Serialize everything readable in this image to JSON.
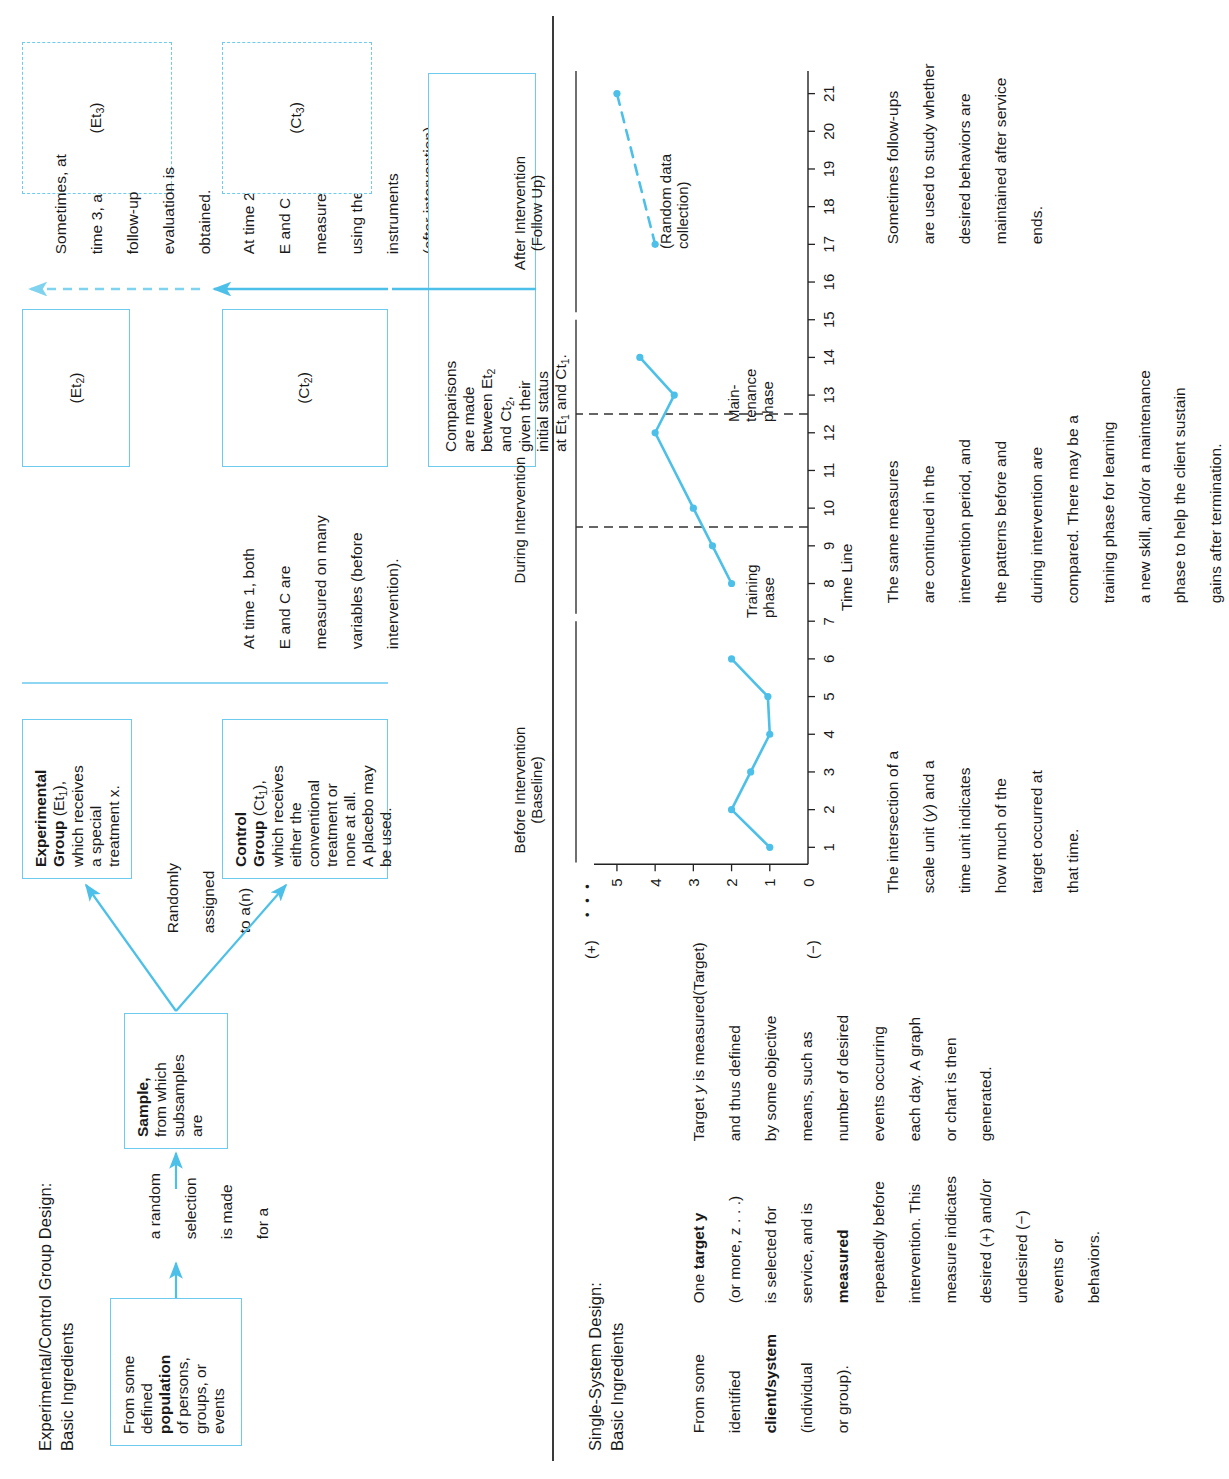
{
  "top_section": {
    "title_line1": "Experimental/Control Group Design:",
    "title_line2": "Basic Ingredients",
    "population_box": {
      "l1": "From some",
      "l2": "defined",
      "l3_bold": "population",
      "l4": "of persons,",
      "l5": "groups, or",
      "l6": "events"
    },
    "arrow_note_1": {
      "l1": "a random",
      "l2": "selection",
      "l3": "is made",
      "l4": "for a"
    },
    "sample_box": {
      "l1_bold": "Sample,",
      "l2": "from which",
      "l3": "subsamples",
      "l4": "are"
    },
    "arrow_note_2": {
      "l1": "Randomly",
      "l2": "assigned",
      "l3": "to a(n)"
    },
    "experimental_box": {
      "l1_bold": "Experimental",
      "l2_bold": "Group",
      "l2_rest": " (Et",
      "l2_sub": "1",
      "l2_end": "),",
      "l3": "which receives",
      "l4": "a special",
      "l5": "treatment x."
    },
    "control_box": {
      "l1_bold": "Control",
      "l2_bold": "Group",
      "l2_rest": " (Ct",
      "l2_sub": "1",
      "l2_end": "),",
      "l3": "which receives",
      "l4": "either the",
      "l5": "conventional",
      "l6": "treatment or",
      "l7": "none at all.",
      "l8": "A placebo may",
      "l9": "be used."
    },
    "time1_note": {
      "l1": "At time 1, both",
      "l2": "E and C are",
      "l3": "measured on many",
      "l4": "variables (before",
      "l5": "intervention)."
    },
    "et2_box_label": "(Et",
    "et2_box_sub": "2",
    "et2_box_end": ")",
    "ct2_box_label": "(Ct",
    "ct2_box_sub": "2",
    "ct2_box_end": ")",
    "time2_note": {
      "l1": "At time 2, both",
      "l2": "E and C are",
      "l3": "measured again",
      "l4": "using the same",
      "l5": "instruments",
      "l6": "(after intervention)."
    },
    "comparisons_box": {
      "l1": "Comparisons",
      "l2": "are made",
      "l3": "between Et",
      "l3_sub": "2",
      "l4": "and Ct",
      "l4_sub": "2",
      "l4_end": ",",
      "l5": "given their",
      "l6": "initial status",
      "l7a": "at Et",
      "l7_sub1": "1",
      "l7b": " and Ct",
      "l7_sub2": "1",
      "l7_end": "."
    },
    "et3_box_label": "(Et",
    "et3_box_sub": "3",
    "et3_box_end": ")",
    "ct3_box_label": "(Ct",
    "ct3_box_sub": "3",
    "ct3_box_end": ")",
    "time3_note": {
      "l1": "Sometimes, at",
      "l2": "time 3, a",
      "l3": "follow-up",
      "l4": "evaluation is",
      "l5": "obtained."
    }
  },
  "bottom_section": {
    "title_line1": "Single-System Design:",
    "title_line2": "Basic Ingredients",
    "client_note": {
      "l1": "From some",
      "l2": "identified",
      "l3_bold": "client/system",
      "l4": "(individual",
      "l5": "or group)."
    },
    "target_note": {
      "l1a": "One ",
      "l1_bold": "target y",
      "l2": "(or more, z . . .)",
      "l3": "is selected for",
      "l4": "service, and is",
      "l5_bold": "measured",
      "l6": "repeatedly before",
      "l7": "intervention. This",
      "l8": "measure indicates",
      "l9": "desired (+) and/or",
      "l10": "undesired (−)",
      "l11": "events or",
      "l12": "behaviors."
    },
    "target_def_note": {
      "l1a": "Target ",
      "l1_ital": "y",
      "l1b": " is measured",
      "l2": "and thus defined",
      "l3": "by some objective",
      "l4": "means, such as",
      "l5": "number of desired",
      "l6": "events occurring",
      "l7": "each day. A graph",
      "l8": "or chart is then",
      "l9": "generated."
    },
    "intersection_note": {
      "l1": "The intersection of a",
      "l2a": "scale unit (",
      "l2_ital": "y",
      "l2b": ") and a",
      "l3": "time unit indicates",
      "l4": "how much of the",
      "l5": "target occurred at",
      "l6": "that time."
    },
    "intervention_note": {
      "l1": "The same measures",
      "l2": "are continued in the",
      "l3": "intervention period, and",
      "l4": "the patterns before and",
      "l5": "during intervention are",
      "l6": "compared. There may be a",
      "l7": "training phase for learning",
      "l8": "a new skill, and/or a maintenance",
      "l9": "phase to help the client sustain",
      "l10": "gains after termination."
    },
    "followup_note": {
      "l1": "Sometimes follow-ups",
      "l2": "are used to study whether",
      "l3": "desired behaviors are",
      "l4": "maintained after service",
      "l5": "ends."
    }
  },
  "chart_data": {
    "type": "line",
    "title": "",
    "xlabel": "Time Line",
    "ylabel": "(Target)",
    "x": [
      1,
      2,
      3,
      4,
      5,
      6,
      7,
      8,
      9,
      10,
      11,
      12,
      13,
      14,
      15,
      16,
      17,
      18,
      19,
      20,
      21
    ],
    "xlim": [
      0,
      21.6
    ],
    "ylim": [
      0,
      5.6
    ],
    "y_ticks": [
      "0",
      "1",
      "2",
      "3",
      "4",
      "5"
    ],
    "y_axis_top_symbol": "(+)",
    "y_axis_top_dots": "• • •",
    "y_axis_zero_symbol": "(−)",
    "grid": false,
    "legend": "none",
    "accent_color": "#4cc0e8",
    "series": [
      {
        "name": "Baseline",
        "style": "solid",
        "points": [
          {
            "x": 1,
            "y": 1
          },
          {
            "x": 2,
            "y": 2
          },
          {
            "x": 3,
            "y": 1.5
          },
          {
            "x": 4,
            "y": 1
          },
          {
            "x": 5,
            "y": 1.05
          },
          {
            "x": 6,
            "y": 2
          }
        ]
      },
      {
        "name": "During Intervention",
        "style": "solid",
        "points": [
          {
            "x": 8,
            "y": 2
          },
          {
            "x": 9,
            "y": 2.5
          },
          {
            "x": 10,
            "y": 3
          },
          {
            "x": 12,
            "y": 4
          },
          {
            "x": 13,
            "y": 3.5
          },
          {
            "x": 14,
            "y": 4.4
          }
        ]
      },
      {
        "name": "After Intervention (Follow Up)",
        "style": "dashed",
        "points": [
          {
            "x": 17,
            "y": 4
          },
          {
            "x": 21,
            "y": 5
          }
        ]
      }
    ],
    "phase_headers": [
      {
        "label_l1": "Before Intervention",
        "label_l2": "(Baseline)",
        "from": 1,
        "to": 7
      },
      {
        "label_l1": "During Intervention",
        "label_l2": "",
        "from": 7.6,
        "to": 15
      },
      {
        "label_l1": "After Intervention",
        "label_l2": "(Follow Up)",
        "from": 15.6,
        "to": 21.6
      }
    ],
    "phase_dividers": [
      9.5,
      12.5
    ],
    "inner_labels": [
      {
        "l1": "Training",
        "l2": "phase",
        "x": 8.0
      },
      {
        "l1": "Main-",
        "l2": "tenance",
        "l3": "phase",
        "x": 13.0
      }
    ],
    "annotation": {
      "l1": "(Random data",
      "l2": "collection)",
      "x": 17.4,
      "y": 3.15
    }
  }
}
